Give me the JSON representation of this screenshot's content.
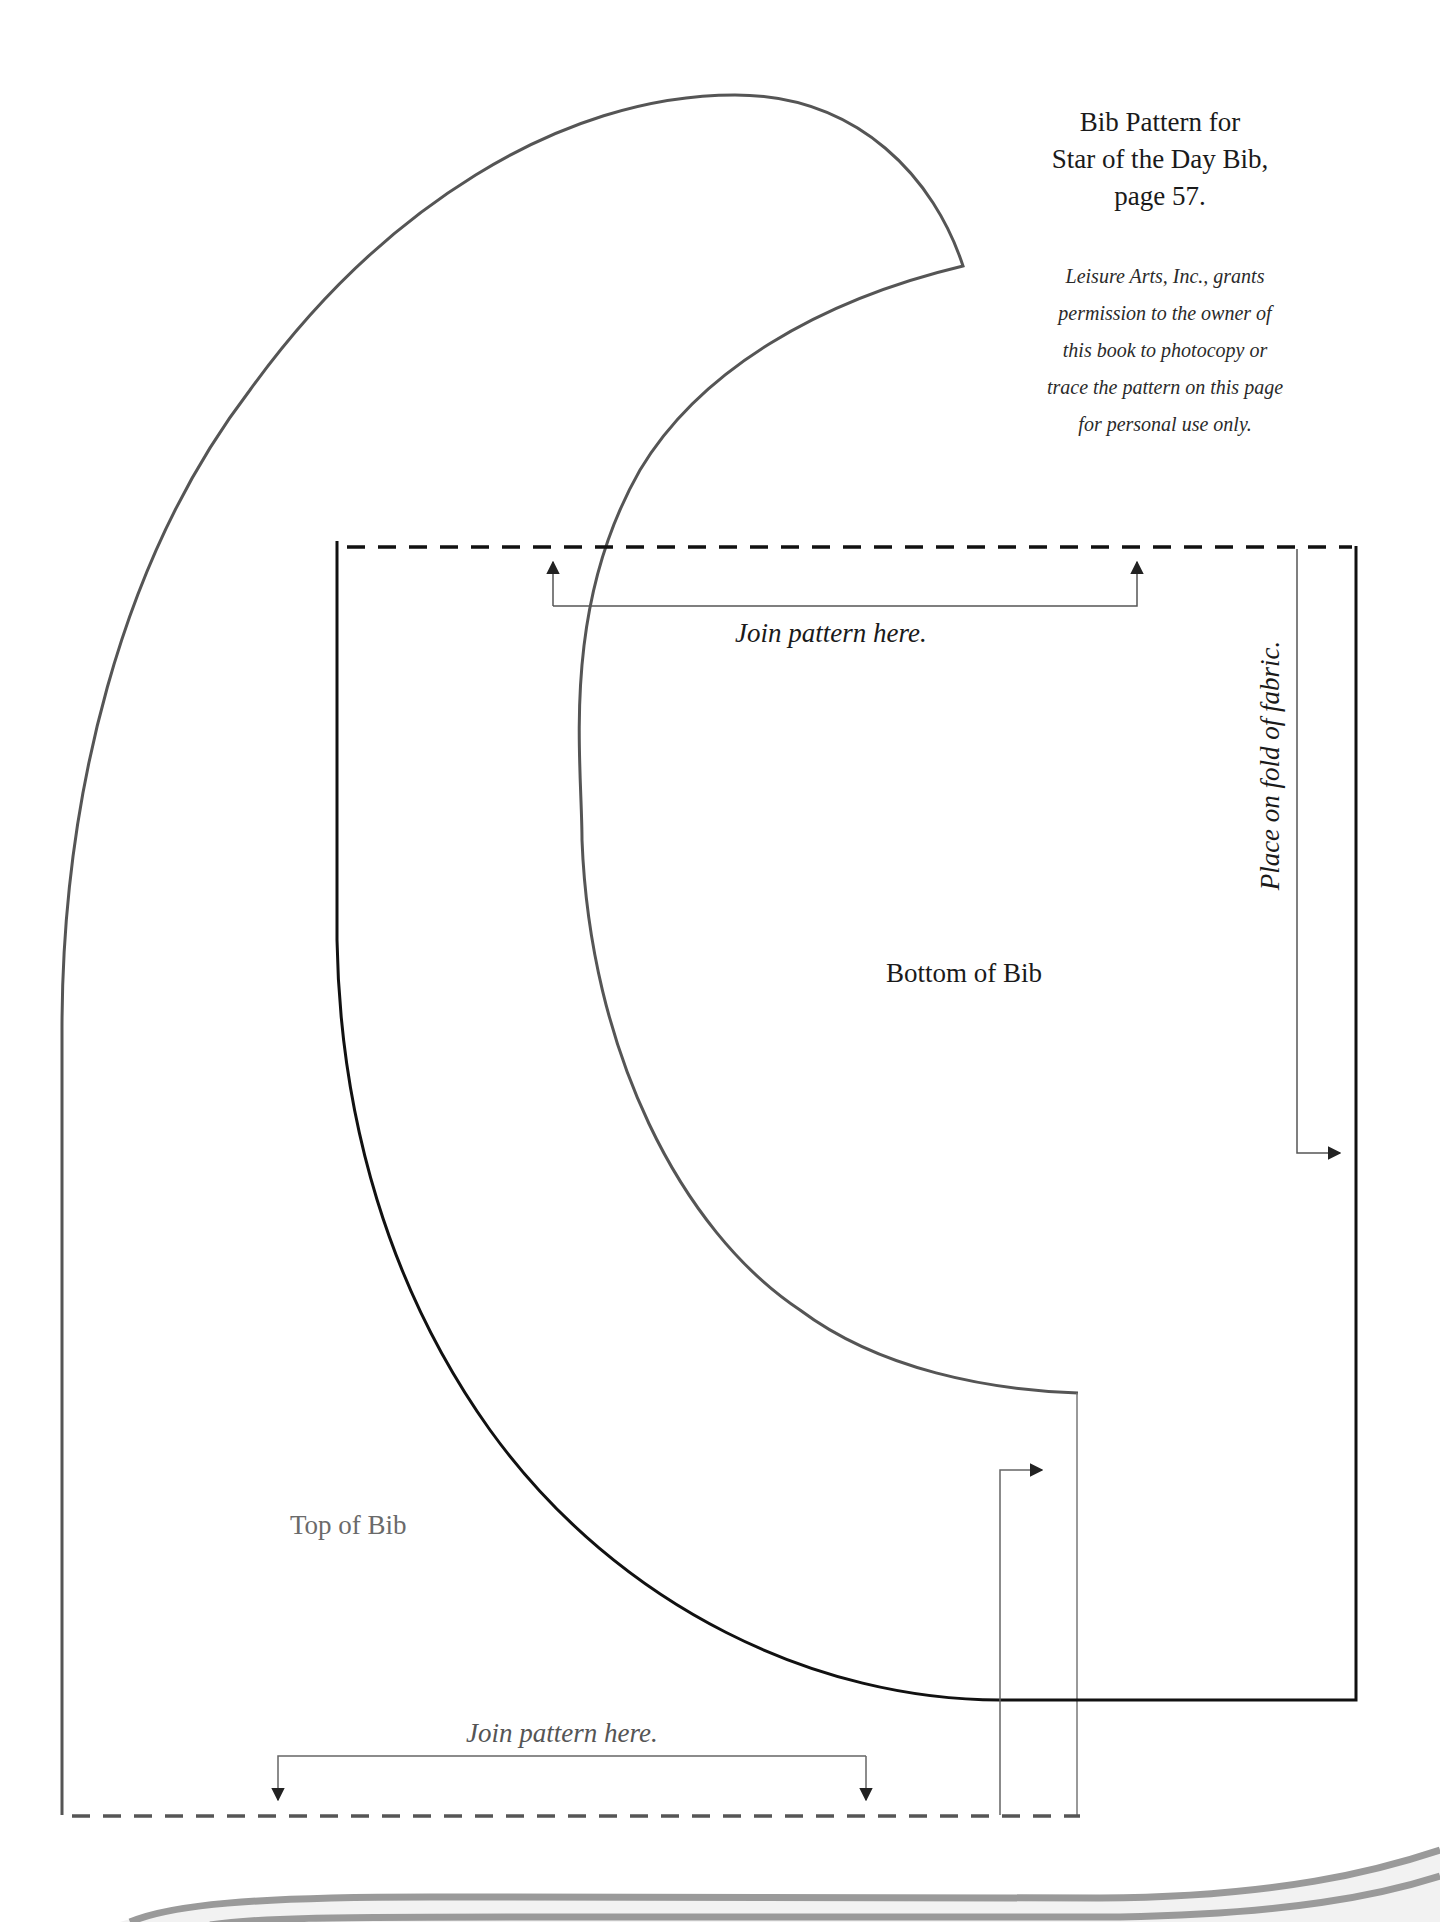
{
  "page": {
    "title_lines": [
      "Bib Pattern for",
      "Star of the Day Bib,",
      "page 57."
    ],
    "permission_lines": [
      "Leisure Arts, Inc., grants",
      "permission to the owner of",
      "this book to photocopy or",
      "trace the pattern on this page",
      "for personal use only."
    ]
  },
  "pattern": {
    "top_join_label": "Join pattern here.",
    "bottom_join_label": "Join pattern here.",
    "bottom_piece_label": "Bottom of Bib",
    "top_piece_label": "Top of Bib",
    "fold_label": "Place on fold of fabric."
  },
  "colors": {
    "background": "#ffffff",
    "cut_line_dark": "#111111",
    "cut_line_gray": "#555555",
    "guide_line": "#777777",
    "decor_wave": "#9a9a9a",
    "decor_wave_fill": "#f2f2f2"
  }
}
